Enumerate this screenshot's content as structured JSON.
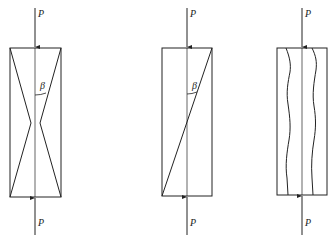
{
  "figures": [
    {
      "id": "a",
      "load_top": "P",
      "load_bottom": "P",
      "angle": "β",
      "failure_mode": "cone (X-shaped) fracture"
    },
    {
      "id": "b",
      "load_top": "P",
      "load_bottom": "P",
      "angle": "β",
      "failure_mode": "single inclined shear plane"
    },
    {
      "id": "c",
      "load_top": "P",
      "load_bottom": "P",
      "failure_mode": "axial splitting"
    }
  ]
}
